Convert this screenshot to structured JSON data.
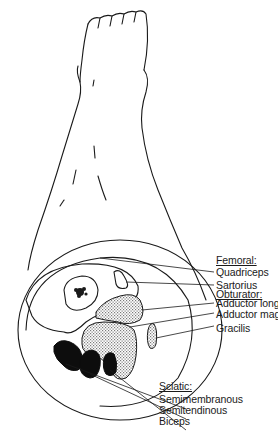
{
  "figure": {
    "colors": {
      "line": "#1a1a1a",
      "background": "#ffffff",
      "hatch": "#8a8a8a",
      "sciatic_fill": "#0d0d0d"
    }
  },
  "labels": {
    "femoral": {
      "header": "Femoral:",
      "items": [
        "Quadriceps",
        "Sartorius"
      ]
    },
    "obturator": {
      "header": "Obturator:",
      "items": [
        "Adductor longus",
        "Adductor magnus",
        "Gracilis"
      ]
    },
    "sciatic": {
      "header": "Sciatic:",
      "items": [
        "Semimembranous",
        "Semitendinous",
        "Biceps"
      ]
    }
  }
}
